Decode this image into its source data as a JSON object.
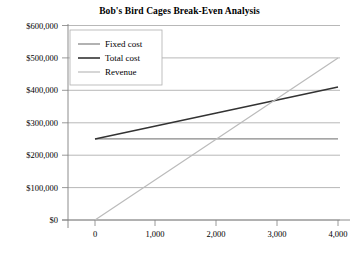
{
  "chart_data": {
    "type": "line",
    "title": "Bob's Bird Cages Break-Even Analysis",
    "xlabel": "",
    "ylabel": "",
    "xlim": [
      0,
      4000
    ],
    "ylim": [
      0,
      600000
    ],
    "x": [
      0,
      1000,
      2000,
      3000,
      4000
    ],
    "x_tick_labels": [
      "0",
      "1,000",
      "2,000",
      "3,000",
      "4,000"
    ],
    "y_ticks": [
      0,
      100000,
      200000,
      300000,
      400000,
      500000,
      600000
    ],
    "y_tick_labels": [
      "$0",
      "$100,000",
      "$200,000",
      "$300,000",
      "$400,000",
      "$500,000",
      "$600,000"
    ],
    "grid": "horizontal",
    "legend_position": "upper-left-inside",
    "series": [
      {
        "name": "Fixed cost",
        "values": [
          250000,
          250000,
          250000,
          250000,
          250000
        ],
        "color": "#888888",
        "width": 1.3
      },
      {
        "name": "Total cost",
        "values": [
          250000,
          290000,
          330000,
          370000,
          410000
        ],
        "color": "#333333",
        "width": 1.5
      },
      {
        "name": "Revenue",
        "values": [
          0,
          125000,
          250000,
          375000,
          500000
        ],
        "color": "#bbbbbb",
        "width": 1.2
      }
    ],
    "break_even": {
      "units": 3000,
      "amount": 370000
    }
  },
  "legend": {
    "entries": [
      "Fixed cost",
      "Total cost",
      "Revenue"
    ]
  }
}
